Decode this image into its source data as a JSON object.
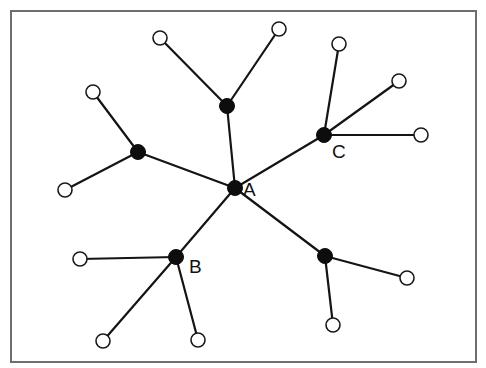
{
  "diagram": {
    "type": "tree-network",
    "frame": {
      "x": 11,
      "y": 11,
      "width": 465,
      "height": 351
    },
    "colors": {
      "hub": "#0d0d0d",
      "leaf_fill": "#ffffff",
      "edge": "#141414",
      "frame": "#6e6e6e"
    },
    "hubs": [
      {
        "id": "A",
        "label": "A",
        "x": 235,
        "y": 188
      },
      {
        "id": "B",
        "label": "B",
        "x": 176,
        "y": 257
      },
      {
        "id": "C",
        "label": "C",
        "x": 324,
        "y": 135
      },
      {
        "id": "H1",
        "label": "",
        "x": 227,
        "y": 106
      },
      {
        "id": "H2",
        "label": "",
        "x": 138,
        "y": 152
      },
      {
        "id": "H3",
        "label": "",
        "x": 325,
        "y": 256
      }
    ],
    "leaves": [
      {
        "id": "L1",
        "x": 160,
        "y": 38
      },
      {
        "id": "L2",
        "x": 279,
        "y": 29
      },
      {
        "id": "L3",
        "x": 93,
        "y": 92
      },
      {
        "id": "L4",
        "x": 65,
        "y": 190
      },
      {
        "id": "L5",
        "x": 339,
        "y": 44
      },
      {
        "id": "L6",
        "x": 399,
        "y": 81
      },
      {
        "id": "L7",
        "x": 421,
        "y": 135
      },
      {
        "id": "L8",
        "x": 80,
        "y": 259
      },
      {
        "id": "L9",
        "x": 103,
        "y": 341
      },
      {
        "id": "L10",
        "x": 198,
        "y": 340
      },
      {
        "id": "L11",
        "x": 407,
        "y": 278
      },
      {
        "id": "L12",
        "x": 333,
        "y": 325
      }
    ],
    "edges": [
      [
        "A",
        "H1"
      ],
      [
        "A",
        "H2"
      ],
      [
        "A",
        "C"
      ],
      [
        "A",
        "B"
      ],
      [
        "A",
        "H3"
      ],
      [
        "H1",
        "L1"
      ],
      [
        "H1",
        "L2"
      ],
      [
        "H2",
        "L3"
      ],
      [
        "H2",
        "L4"
      ],
      [
        "C",
        "L5"
      ],
      [
        "C",
        "L6"
      ],
      [
        "C",
        "L7"
      ],
      [
        "B",
        "L8"
      ],
      [
        "B",
        "L9"
      ],
      [
        "B",
        "L10"
      ],
      [
        "H3",
        "L11"
      ],
      [
        "H3",
        "L12"
      ]
    ],
    "labels": [
      {
        "text": "A",
        "x": 243,
        "y": 196
      },
      {
        "text": "B",
        "x": 189,
        "y": 273
      },
      {
        "text": "C",
        "x": 332,
        "y": 158
      }
    ]
  }
}
